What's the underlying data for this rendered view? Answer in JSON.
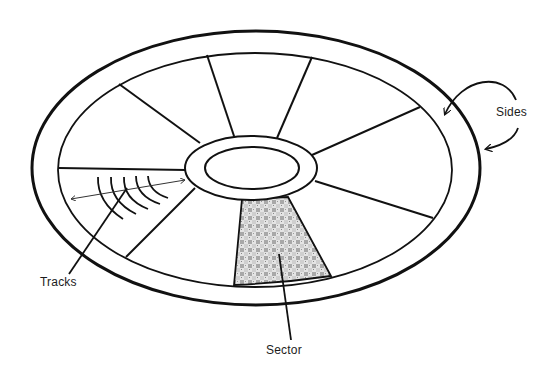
{
  "diagram": {
    "labels": {
      "sides": "Sides",
      "tracks": "Tracks",
      "sector": "Sector"
    },
    "colors": {
      "stroke": "#111111",
      "background": "#ffffff",
      "sector_fill": "#b9b9b9"
    },
    "parts": [
      "outer-edge",
      "inner-edge",
      "hub",
      "spindle-hole",
      "spokes",
      "sector",
      "tracks",
      "sides-arrows"
    ],
    "spoke_count": 8
  }
}
